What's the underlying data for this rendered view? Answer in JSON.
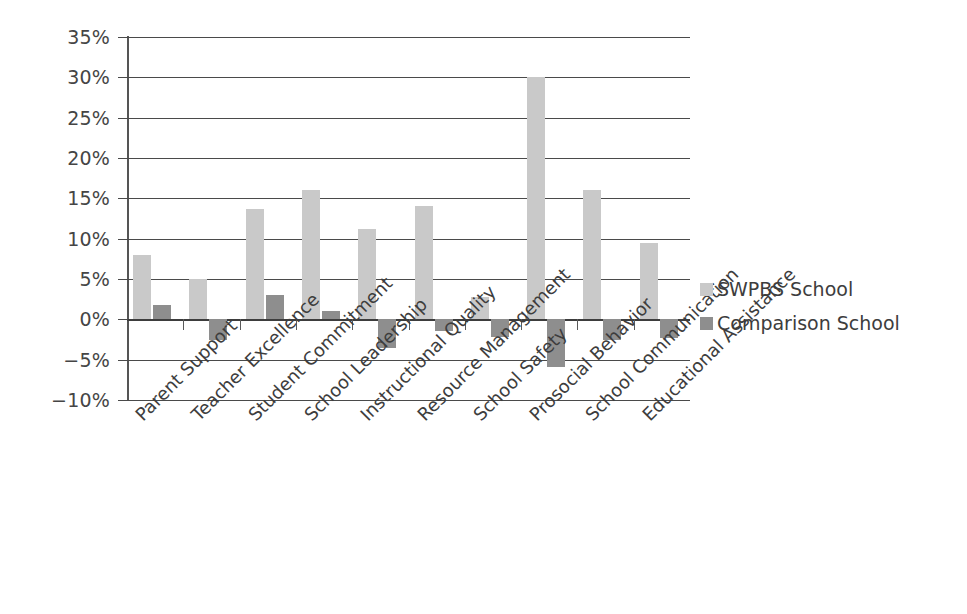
{
  "chart_data": {
    "type": "bar",
    "title": "",
    "subtitle": "",
    "xlabel": "",
    "ylabel": "",
    "ylim": [
      -10,
      35
    ],
    "ytick_step": 5,
    "ytick_labels": [
      "35%",
      "30%",
      "25%",
      "20%",
      "15%",
      "10%",
      "5%",
      "0%",
      "−5%",
      "−10%"
    ],
    "ytick_values": [
      35,
      30,
      25,
      20,
      15,
      10,
      5,
      0,
      -5,
      -10
    ],
    "grid": true,
    "grid_axis": "y",
    "legend_position": "right",
    "categories": [
      "Parent Support",
      "Teacher Excellence",
      "Student Commitment",
      "School Leadership",
      "Instructional Quality",
      "Resource Management",
      "School Safety",
      "Prosocial Behavior",
      "School Communication",
      "Educational Assistance"
    ],
    "series": [
      {
        "name": "SWPBS School",
        "color": "#c9c9c9",
        "values": [
          8.0,
          5.0,
          13.7,
          16.0,
          11.2,
          14.0,
          2.8,
          30.0,
          16.0,
          9.5
        ]
      },
      {
        "name": "Comparison School",
        "color": "#8e8e8e",
        "values": [
          1.8,
          -2.5,
          3.0,
          1.0,
          -3.6,
          -1.5,
          -2.2,
          -5.9,
          -2.6,
          -2.3
        ]
      }
    ]
  },
  "legend": {
    "items": [
      {
        "label": "SWPBS School",
        "color": "#c9c9c9"
      },
      {
        "label": "Comparison School",
        "color": "#8e8e8e"
      }
    ]
  },
  "colors": {
    "series_light": "#c9c9c9",
    "series_dark": "#8e8e8e",
    "axis": "#4a4a4a",
    "text": "#3d3d3d",
    "background": "#ffffff"
  }
}
